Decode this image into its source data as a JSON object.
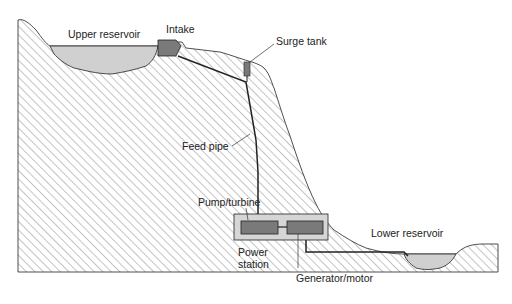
{
  "diagram": {
    "type": "pumped-storage hydroelectric scheme cross-section",
    "labels": {
      "upper_reservoir": "Upper reservoir",
      "intake": "Intake",
      "surge_tank": "Surge tank",
      "feed_pipe": "Feed pipe",
      "pump_turbine": "Pump/turbine",
      "power_station_line1": "Power",
      "power_station_line2": "station",
      "lower_reservoir": "Lower reservoir",
      "generator_motor": "Generator/motor"
    },
    "colors": {
      "hatch": "#8a8a8a",
      "water": "#d0d0d0",
      "structure": "#7a7a7a",
      "station_box": "#d6d6d6",
      "outline": "#222222"
    }
  }
}
